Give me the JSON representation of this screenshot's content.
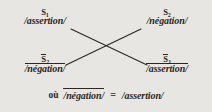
{
  "diagram": {
    "type": "semiotic-square",
    "language": "fr",
    "background_color": "#e8e6e2",
    "ink_color": "#2b2723",
    "nodes": {
      "top_left": {
        "label_base": "S",
        "label_sub": "1",
        "label_overlined": false,
        "term": "/assertion/",
        "term_overlined": false
      },
      "top_right": {
        "label_base": "S",
        "label_sub": "2",
        "label_overlined": false,
        "term": "/négation/",
        "term_overlined": false
      },
      "bottom_left": {
        "label_base": "S",
        "label_sub": "2",
        "label_overlined": true,
        "term": "/négation/",
        "term_overlined": true
      },
      "bottom_right": {
        "label_base": "S",
        "label_sub": "1",
        "label_overlined": true,
        "term": "/assertion/",
        "term_overlined": true
      }
    },
    "connectors": [
      {
        "name": "diagonal-top-left-to-bottom-right",
        "from": "top_left",
        "to": "bottom_right"
      },
      {
        "name": "diagonal-top-right-to-bottom-left",
        "from": "top_right",
        "to": "bottom_left"
      }
    ],
    "equation": {
      "lead_word": "où",
      "left_term": "/négation/",
      "left_term_overlined": true,
      "operator": "=",
      "right_term": "/assertion/",
      "right_term_overlined": false
    }
  }
}
